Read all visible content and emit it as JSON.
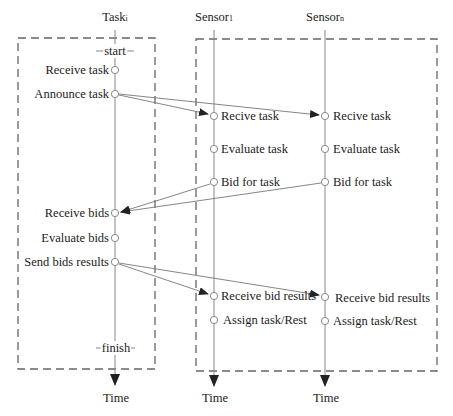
{
  "lifelines": [
    {
      "id": "task",
      "title": "Task",
      "subscript": "i",
      "x": 115,
      "time_label": "Time"
    },
    {
      "id": "sensor1",
      "title": "Sensor",
      "subscript": "1",
      "x": 214,
      "time_label": "Time"
    },
    {
      "id": "sensorn",
      "title": "Sensor",
      "subscript": "n",
      "x": 325,
      "time_label": "Time"
    }
  ],
  "task": {
    "start_label": "start",
    "finish_label": "finish",
    "events": [
      {
        "label": "Receive task",
        "y": 70
      },
      {
        "label": "Announce task",
        "y": 94
      },
      {
        "label": "Receive bids",
        "y": 213
      },
      {
        "label": "Evaluate bids",
        "y": 238
      },
      {
        "label": "Send bids results",
        "y": 262
      }
    ]
  },
  "sensor1": {
    "events": [
      {
        "label": "Recive task",
        "y": 116
      },
      {
        "label": "Evaluate task",
        "y": 149
      },
      {
        "label": "Bid for task",
        "y": 182
      },
      {
        "label": "Receive bid results",
        "y": 296
      },
      {
        "label": "Assign task/Rest",
        "y": 320
      }
    ]
  },
  "sensorn": {
    "events": [
      {
        "label": "Recive task",
        "y": 116
      },
      {
        "label": "Evaluate task",
        "y": 149
      },
      {
        "label": "Bid for task",
        "y": 182
      },
      {
        "label": "Receive bid results",
        "y": 297
      },
      {
        "label": "Assign task/Rest",
        "y": 321
      }
    ]
  },
  "messages": [
    {
      "from": "Announce task",
      "to": "Sensor1 Recive task"
    },
    {
      "from": "Announce task",
      "to": "SensorN Recive task"
    },
    {
      "from": "Sensor1 Bid for task",
      "to": "Receive bids"
    },
    {
      "from": "SensorN Bid for task",
      "to": "Receive bids"
    },
    {
      "from": "Send bids results",
      "to": "Sensor1 Receive bid results"
    },
    {
      "from": "Send bids results",
      "to": "SensorN Receive bid results"
    }
  ]
}
